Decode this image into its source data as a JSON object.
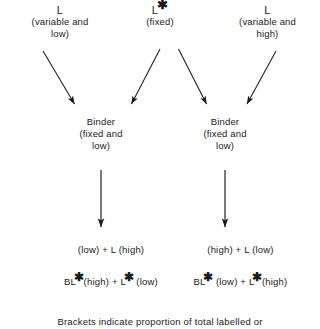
{
  "diagram": {
    "sources": [
      {
        "symbol": "L",
        "starred": false,
        "qualifier_line1": "(variable and",
        "qualifier_line2": "low)"
      },
      {
        "symbol": "L",
        "starred": true,
        "qualifier_line1": "(fixed)",
        "qualifier_line2": ""
      },
      {
        "symbol": "L",
        "starred": false,
        "qualifier_line1": "(variable and",
        "qualifier_line2": "high)"
      }
    ],
    "binders": [
      {
        "symbol": "Binder",
        "qualifier_line1": "(fixed and",
        "qualifier_line2": "low)"
      },
      {
        "symbol": "Binder",
        "qualifier_line1": "(fixed and",
        "qualifier_line2": "low)"
      }
    ],
    "results": [
      {
        "line1": [
          {
            "text": "BL",
            "star": false
          },
          {
            "text": " (low)  +  L (high)",
            "star": false
          }
        ],
        "line2": [
          {
            "text": "BL",
            "star": true
          },
          {
            "text": "(high)  +  L",
            "star": true
          },
          {
            "text": " (low)",
            "star": false
          }
        ]
      },
      {
        "line1": [
          {
            "text": "BL",
            "star": false
          },
          {
            "text": " (high)  +  L (low)",
            "star": false
          }
        ],
        "line2": [
          {
            "text": "BL",
            "star": true
          },
          {
            "text": " (low)  +  L",
            "star": true
          },
          {
            "text": "(high)",
            "star": false
          }
        ]
      }
    ],
    "result_strings": {
      "left_line1": "BL (low)  +  L (high)",
      "left_line2": "BL*(high)  +  L* (low)",
      "right_line1": "BL (high)  +  L (low)",
      "right_line2": "BL* (low)  +  L*(high)"
    },
    "caption": "Brackets indicate proportion of total labelled or",
    "ink_color": "#1a1a1a",
    "background_color": "#ffffff"
  }
}
